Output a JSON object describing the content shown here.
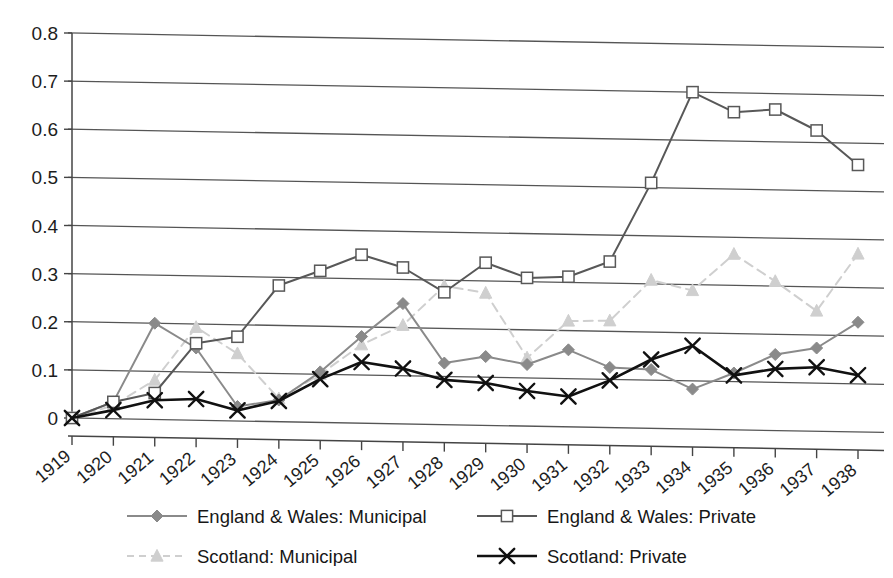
{
  "chart_data": {
    "type": "line",
    "title": "",
    "subtitle": "",
    "xlabel": "",
    "ylabel": "",
    "xlim": [
      1919,
      1938
    ],
    "ylim": [
      0,
      0.8
    ],
    "grid": true,
    "legend_position": "bottom",
    "x": [
      1919,
      1920,
      1921,
      1922,
      1923,
      1924,
      1925,
      1926,
      1927,
      1928,
      1929,
      1930,
      1931,
      1932,
      1933,
      1934,
      1935,
      1936,
      1937,
      1938
    ],
    "categories": [
      "1919",
      "1920",
      "1921",
      "1922",
      "1923",
      "1924",
      "1925",
      "1926",
      "1927",
      "1928",
      "1929",
      "1930",
      "1931",
      "1932",
      "1933",
      "1934",
      "1935",
      "1936",
      "1937",
      "1938"
    ],
    "yticks": [
      0,
      0.1,
      0.2,
      0.3,
      0.4,
      0.5,
      0.6,
      0.7,
      0.8
    ],
    "ytick_labels": [
      "0",
      "0.1",
      "0.2",
      "0.3",
      "0.4",
      "0.5",
      "0.6",
      "0.7",
      "0.8"
    ],
    "series": [
      {
        "name": "England & Wales: Municipal",
        "marker": "diamond",
        "color": "#8a8a8a",
        "dash": "solid",
        "values": [
          0.0,
          0.035,
          0.2,
          0.15,
          0.03,
          0.045,
          0.105,
          0.18,
          0.25,
          0.128,
          0.143,
          0.128,
          0.16,
          0.125,
          0.122,
          0.083,
          0.118,
          0.158,
          0.173,
          0.228
        ]
      },
      {
        "name": "England & Wales: Private",
        "marker": "open-square",
        "color": "#585858",
        "dash": "solid",
        "values": [
          0.0,
          0.035,
          0.055,
          0.16,
          0.175,
          0.283,
          0.315,
          0.35,
          0.325,
          0.275,
          0.338,
          0.308,
          0.312,
          0.345,
          0.51,
          0.7,
          0.66,
          0.667,
          0.625,
          0.555
        ]
      },
      {
        "name": "Scotland: Municipal",
        "marker": "triangle",
        "color": "#cfcfcf",
        "dash": "dashed",
        "values": [
          0.0,
          0.028,
          0.082,
          0.193,
          0.14,
          0.048,
          0.1,
          0.163,
          0.205,
          0.288,
          0.275,
          0.142,
          0.22,
          0.222,
          0.308,
          0.288,
          0.365,
          0.31,
          0.25,
          0.37
        ]
      },
      {
        "name": "Scotland: Private",
        "marker": "cross-x",
        "color": "#111111",
        "dash": "solid",
        "values": [
          0.0,
          0.018,
          0.04,
          0.044,
          0.022,
          0.043,
          0.09,
          0.127,
          0.115,
          0.093,
          0.088,
          0.073,
          0.063,
          0.098,
          0.143,
          0.173,
          0.113,
          0.128,
          0.133,
          0.118
        ]
      }
    ],
    "legend_entries": [
      {
        "label": "England & Wales: Municipal",
        "marker": "diamond",
        "color": "#8a8a8a",
        "dash": "solid"
      },
      {
        "label": "England & Wales: Private",
        "marker": "open-square",
        "color": "#585858",
        "dash": "solid"
      },
      {
        "label": "Scotland: Municipal",
        "marker": "triangle",
        "color": "#cfcfcf",
        "dash": "dashed"
      },
      {
        "label": "Scotland: Private",
        "marker": "cross-x",
        "color": "#111111",
        "dash": "solid"
      }
    ]
  },
  "axes": {
    "y_tick_labels": [
      "0.8",
      "0.7",
      "0.6",
      "0.5",
      "0.4",
      "0.3",
      "0.2",
      "0.1",
      "0"
    ],
    "x_tick_labels": [
      "1919",
      "1920",
      "1921",
      "1922",
      "1923",
      "1924",
      "1925",
      "1926",
      "1927",
      "1928",
      "1929",
      "1930",
      "1931",
      "1932",
      "1933",
      "1934",
      "1935",
      "1936",
      "1937",
      "1938"
    ]
  },
  "legend": {
    "items": [
      "England & Wales: Municipal",
      "England & Wales: Private",
      "Scotland: Municipal",
      "Scotland: Private"
    ]
  }
}
